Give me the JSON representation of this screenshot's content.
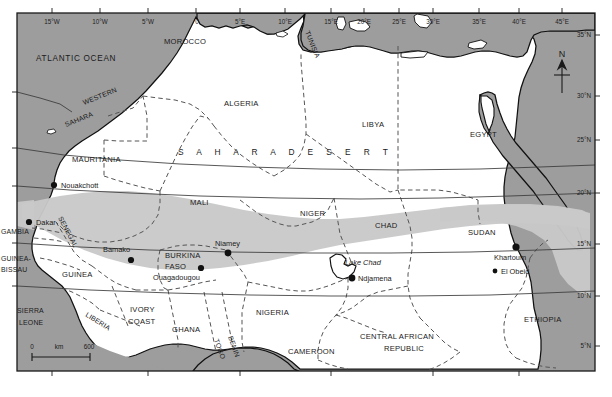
{
  "map": {
    "title": "Sahel and Sahara Desert region of northern Africa",
    "colors": {
      "sea": "#9d9d9d",
      "land": "#ffffff",
      "sahel_band": "#c9c9c9",
      "coast_line": "#111111",
      "border_line": "#555555",
      "graticule": "#3a3a3a",
      "text": "#1a1a1a"
    },
    "graticule": {
      "longitude_labels": [
        {
          "text": "15°W",
          "x": 52
        },
        {
          "text": "10°W",
          "x": 100
        },
        {
          "text": "5°W",
          "x": 148
        },
        {
          "text": "0",
          "x": 196
        },
        {
          "text": "5°E",
          "x": 240
        },
        {
          "text": "10°E",
          "x": 285
        },
        {
          "text": "15°E",
          "x": 331
        },
        {
          "text": "20°E",
          "x": 364
        },
        {
          "text": "25°E",
          "x": 399
        },
        {
          "text": "30°E",
          "x": 433
        },
        {
          "text": "35°E",
          "x": 479
        },
        {
          "text": "40°E",
          "x": 519
        },
        {
          "text": "45°E",
          "x": 562
        }
      ],
      "latitude_labels": [
        {
          "text": "35°N",
          "y": 35
        },
        {
          "text": "30°N",
          "y": 96
        },
        {
          "text": "25°N",
          "y": 140
        },
        {
          "text": "20°N",
          "y": 193
        },
        {
          "text": "15°N",
          "y": 244
        },
        {
          "text": "10°N",
          "y": 296
        },
        {
          "text": "5°N",
          "y": 346
        }
      ]
    },
    "water_labels": [
      {
        "name": "atlantic-ocean",
        "text": "ATLANTIC OCEAN",
        "x": 36,
        "y": 61
      }
    ],
    "region_labels": [
      {
        "name": "sahara-desert",
        "text": "S A H A R A     D E S E R T",
        "x": 178,
        "y": 152
      }
    ],
    "countries": [
      {
        "name": "morocco",
        "text": "MOROCCO",
        "x": 164,
        "y": 44,
        "rotate": 0,
        "size": "country"
      },
      {
        "name": "algeria",
        "text": "ALGERIA",
        "x": 224,
        "y": 106,
        "rotate": 0,
        "size": "country"
      },
      {
        "name": "tunisia",
        "text": "TUNISIA",
        "x": 305,
        "y": 32,
        "rotate": 68,
        "size": "country-sm"
      },
      {
        "name": "libya",
        "text": "LIBYA",
        "x": 362,
        "y": 127,
        "rotate": 0,
        "size": "country"
      },
      {
        "name": "egypt",
        "text": "EGYPT",
        "x": 470,
        "y": 137,
        "rotate": 0,
        "size": "country"
      },
      {
        "name": "western-sahara",
        "text": "WESTERN",
        "x": 84,
        "y": 105,
        "rotate": -22,
        "size": "country-sm"
      },
      {
        "name": "western-sahara-2",
        "text": "SAHARA",
        "x": 66,
        "y": 125,
        "rotate": -22,
        "size": "country-sm"
      },
      {
        "name": "mauritania",
        "text": "MAURITANIA",
        "x": 72,
        "y": 162,
        "rotate": 0,
        "size": "country"
      },
      {
        "name": "mali",
        "text": "MALI",
        "x": 190,
        "y": 205,
        "rotate": 0,
        "size": "country"
      },
      {
        "name": "niger",
        "text": "NIGER",
        "x": 300,
        "y": 216,
        "rotate": 0,
        "size": "country"
      },
      {
        "name": "chad",
        "text": "CHAD",
        "x": 375,
        "y": 228,
        "rotate": 0,
        "size": "country"
      },
      {
        "name": "sudan",
        "text": "SUDAN",
        "x": 468,
        "y": 235,
        "rotate": 0,
        "size": "country"
      },
      {
        "name": "senegal",
        "text": "SENEGAL",
        "x": 62,
        "y": 220,
        "rotate": 62,
        "size": "country-sm"
      },
      {
        "name": "gambia",
        "text": "GAMBIA",
        "x": 2,
        "y": 232,
        "rotate": 0,
        "size": "country-sm"
      },
      {
        "name": "guinea-bissau",
        "text": "GUINEA-",
        "x": 1,
        "y": 259,
        "rotate": 0,
        "size": "country-sm"
      },
      {
        "name": "guinea-bissau-2",
        "text": "BISSAU",
        "x": 1,
        "y": 270,
        "rotate": 0,
        "size": "country-sm"
      },
      {
        "name": "guinea",
        "text": "GUINEA",
        "x": 65,
        "y": 274,
        "rotate": 0,
        "size": "country"
      },
      {
        "name": "sierra-leone",
        "text": "SIERRA",
        "x": 17,
        "y": 311,
        "rotate": 0,
        "size": "country-sm"
      },
      {
        "name": "sierra-leone-2",
        "text": "LEONE",
        "x": 19,
        "y": 323,
        "rotate": 0,
        "size": "country-sm"
      },
      {
        "name": "liberia",
        "text": "LIBERIA",
        "x": 85,
        "y": 318,
        "rotate": 32,
        "size": "country-sm"
      },
      {
        "name": "ivory-coast",
        "text": "IVORY",
        "x": 133,
        "y": 311,
        "rotate": 0,
        "size": "country"
      },
      {
        "name": "ivory-coast-2",
        "text": "COAST",
        "x": 133,
        "y": 323,
        "rotate": 0,
        "size": "country"
      },
      {
        "name": "ghana",
        "text": "GHANA",
        "x": 178,
        "y": 330,
        "rotate": 0,
        "size": "country"
      },
      {
        "name": "togo",
        "text": "TOGO",
        "x": 219,
        "y": 343,
        "rotate": 70,
        "size": "country-sm"
      },
      {
        "name": "benin",
        "text": "BENIN",
        "x": 231,
        "y": 340,
        "rotate": 70,
        "size": "country-sm"
      },
      {
        "name": "burkina-faso",
        "text": "BURKINA",
        "x": 167,
        "y": 256,
        "rotate": 0,
        "size": "country"
      },
      {
        "name": "burkina-faso-2",
        "text": "FASO",
        "x": 167,
        "y": 267,
        "rotate": 0,
        "size": "country"
      },
      {
        "name": "nigeria",
        "text": "NIGERIA",
        "x": 258,
        "y": 313,
        "rotate": 0,
        "size": "country"
      },
      {
        "name": "cameroon",
        "text": "CAMEROON",
        "x": 290,
        "y": 352,
        "rotate": 0,
        "size": "country"
      },
      {
        "name": "central-african-republic",
        "text": "CENTRAL AFRICAN",
        "x": 365,
        "y": 337,
        "rotate": 0,
        "size": "country"
      },
      {
        "name": "central-african-republic-2",
        "text": "REPUBLIC",
        "x": 388,
        "y": 349,
        "rotate": 0,
        "size": "country"
      },
      {
        "name": "ethiopia",
        "text": "ETHIOPIA",
        "x": 528,
        "y": 320,
        "rotate": 0,
        "size": "country"
      }
    ],
    "cities": [
      {
        "name": "nouakchott",
        "text": "Nouakchott",
        "cx": 54,
        "cy": 185,
        "r": 3.1,
        "tx": 61,
        "ty": 188
      },
      {
        "name": "dakar",
        "text": "Dakar",
        "cx": 29,
        "cy": 222,
        "r": 3.1,
        "tx": 36,
        "ty": 225
      },
      {
        "name": "bamako",
        "text": "Bamako",
        "cx": 131,
        "cy": 260,
        "r": 3.1,
        "tx": 105,
        "ty": 252
      },
      {
        "name": "ouagadougou",
        "text": "Ouagadougou",
        "cx": 201,
        "cy": 268,
        "r": 3.1,
        "tx": 156,
        "ty": 280
      },
      {
        "name": "niamey",
        "text": "Niamey",
        "cx": 228,
        "cy": 250,
        "r": 3.4,
        "tx": 224,
        "ty": 245
      },
      {
        "name": "ndjamena",
        "text": "Ndjamena",
        "cx": 352,
        "cy": 278,
        "r": 3.4,
        "tx": 358,
        "ty": 281
      },
      {
        "name": "khartoum",
        "text": "Khartoum",
        "cx": 516,
        "cy": 247,
        "r": 3.6,
        "tx": 494,
        "ty": 260
      },
      {
        "name": "el-obeid",
        "text": "El Obeid",
        "cx": 495,
        "cy": 271,
        "r": 2.4,
        "tx": 501,
        "ty": 274
      }
    ],
    "water_features": [
      {
        "name": "lake-chad",
        "text": "Lake Chad",
        "x": 345,
        "y": 265
      }
    ],
    "scale_bar": {
      "start_label": "0",
      "unit_label": "km",
      "end_label": "600",
      "x": 32,
      "y": 353,
      "width": 58
    },
    "compass": {
      "label": "N",
      "x": 562,
      "y": 60
    }
  }
}
